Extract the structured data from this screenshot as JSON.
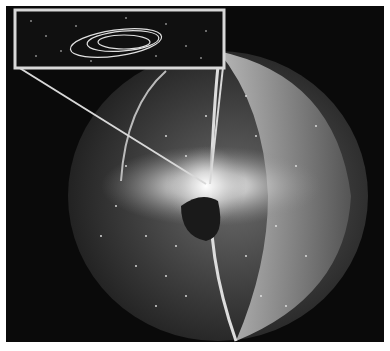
{
  "image": {
    "subject": "Cutaway illustration of a spherical cloud of particles surrounding a bright central region, with an inset showing elliptical orbits",
    "colors": {
      "background": "#0a0a0a",
      "frame": "#d8d8d8",
      "particles": "#e8e8e8",
      "sphere_shell": "#3a3a3a"
    }
  },
  "inset": {
    "description": "Zoomed inset box with star field and three nested elliptical orbits"
  }
}
